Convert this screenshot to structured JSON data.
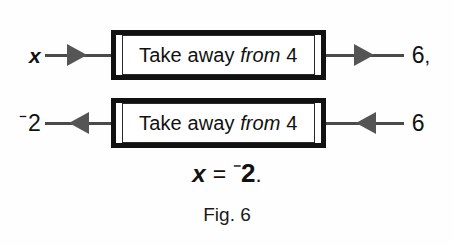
{
  "figure": {
    "caption": "Fig. 6",
    "equation": {
      "variable": "x",
      "equals": "=",
      "negative_sign": "⁻",
      "value": "2",
      "terminator": "."
    },
    "rows": [
      {
        "id": "row-forward",
        "direction": "right",
        "input_label": "x",
        "input_is_variable": true,
        "input_negative": false,
        "box_text_prefix": "Take away ",
        "box_text_italic": "from",
        "box_text_suffix": " 4",
        "output_label": "6",
        "output_negative": false,
        "output_trailing": ",",
        "left_arrow_icon": "arrow-right-icon",
        "right_arrow_icon": "arrow-right-icon"
      },
      {
        "id": "row-inverse",
        "direction": "left",
        "input_label": "2",
        "input_is_variable": false,
        "input_negative": true,
        "box_text_prefix": "Take away ",
        "box_text_italic": "from",
        "box_text_suffix": " 4",
        "output_label": "6",
        "output_negative": false,
        "output_trailing": "",
        "left_arrow_icon": "arrow-left-icon",
        "right_arrow_icon": "arrow-left-icon"
      }
    ]
  },
  "colors": {
    "ink": "#111111",
    "arrow": "#555555",
    "line": "#4a4a4a",
    "background": "#fefefe"
  }
}
